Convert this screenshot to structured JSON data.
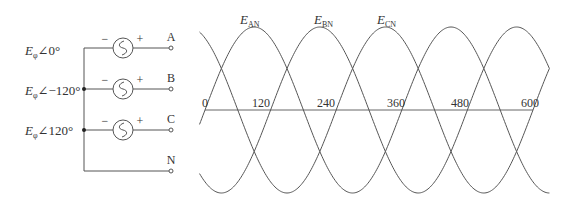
{
  "circuit": {
    "sources": [
      {
        "symbol": "E",
        "subscript": "φ",
        "angle_label": "∠0°",
        "terminal": "A",
        "minus": "−",
        "plus": "+"
      },
      {
        "symbol": "E",
        "subscript": "φ",
        "angle_label": "∠−120°",
        "terminal": "B",
        "minus": "−",
        "plus": "+"
      },
      {
        "symbol": "E",
        "subscript": "φ",
        "angle_label": "∠120°",
        "terminal": "C",
        "minus": "−",
        "plus": "+"
      }
    ],
    "neutral_label": "N"
  },
  "waveform": {
    "axis_ticks": [
      "0",
      "120",
      "240",
      "360",
      "480",
      "600"
    ],
    "curve_labels": [
      {
        "symbol": "E",
        "subscript": "AN"
      },
      {
        "symbol": "E",
        "subscript": "BN"
      },
      {
        "symbol": "E",
        "subscript": "CN"
      }
    ]
  },
  "chart_data": {
    "type": "line",
    "title": "",
    "xlabel": "",
    "ylabel": "",
    "x_range": [
      0,
      600
    ],
    "x_ticks": [
      0,
      120,
      240,
      360,
      480,
      600
    ],
    "grid": false,
    "series": [
      {
        "name": "E_AN",
        "function": "sin(θ)",
        "phase_deg": 0
      },
      {
        "name": "E_BN",
        "function": "sin(θ − 120°)",
        "phase_deg": -120
      },
      {
        "name": "E_CN",
        "function": "sin(θ + 120°)",
        "phase_deg": 120
      }
    ],
    "colors": {
      "line": "#555555"
    }
  }
}
